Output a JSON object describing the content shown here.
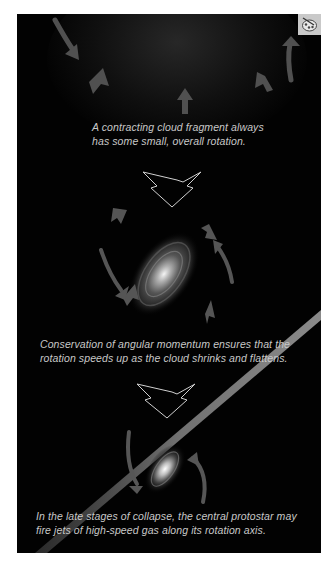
{
  "figure": {
    "stages": [
      {
        "id": "stage-1",
        "caption_lines": [
          "A contracting cloud fragment always",
          "has some small, overall rotation."
        ]
      },
      {
        "id": "stage-2",
        "caption_lines": [
          "Conservation of angular momentum ensures that the",
          "rotation speeds up as the cloud shrinks and flattens."
        ]
      },
      {
        "id": "stage-3",
        "caption_lines": [
          "In the late stages of collapse, the central protostar may",
          "fire jets of high-speed gas along its rotation axis."
        ]
      }
    ],
    "icons": {
      "palette_button": "palette-icon",
      "transition_arrow": "down-arrow-icon",
      "inflow_arrow": "inflow-arrow-icon",
      "rotation_arrow": "curved-arrow-icon"
    },
    "colors": {
      "background": "#020202",
      "caption_text": "#c8c8c8",
      "arrow_fill": "#5a5a5a",
      "palette_button_bg": "#c9c9c9",
      "page_bg": "#ffffff"
    }
  }
}
